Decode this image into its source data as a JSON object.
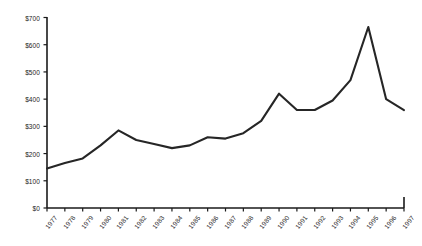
{
  "chart_data": {
    "type": "line",
    "title": "",
    "subtitle": "",
    "xlabel": "",
    "ylabel": "",
    "categories": [
      "1977",
      "1978",
      "1979",
      "1980",
      "1981",
      "1982",
      "1983",
      "1984",
      "1985",
      "1986",
      "1987",
      "1988",
      "1989",
      "1990",
      "1991",
      "1992",
      "1993",
      "1994",
      "1995",
      "1996",
      "1997"
    ],
    "values": [
      145,
      165,
      182,
      230,
      285,
      250,
      235,
      220,
      230,
      260,
      255,
      275,
      320,
      420,
      360,
      360,
      395,
      470,
      665,
      400,
      360
    ],
    "series": [
      {
        "name": "",
        "values": [
          145,
          165,
          182,
          230,
          285,
          250,
          235,
          220,
          230,
          260,
          255,
          275,
          320,
          420,
          360,
          360,
          395,
          470,
          665,
          400,
          360
        ]
      }
    ],
    "value_prefix": "$",
    "ylim": [
      0,
      700
    ],
    "ytick_values": [
      0,
      100,
      200,
      300,
      400,
      500,
      600,
      700
    ],
    "ytick_labels": [
      "$0",
      "$100",
      "$200",
      "$300",
      "$400",
      "$500",
      "$600",
      "$700"
    ],
    "grid": false,
    "legend": false,
    "legend_position": "none",
    "line_color": "#262626",
    "axis_color": "#1a1a1a",
    "background_color": "#ffffff"
  }
}
